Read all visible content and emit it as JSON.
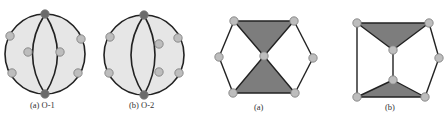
{
  "figure": {
    "panels": [
      {
        "id": "o1",
        "caption": "(a) O-1",
        "shape": "circle",
        "center": [
          45,
          54
        ],
        "radius": 40,
        "fill": "#e6e6e6",
        "stroke": "#222222",
        "arcs": [
          {
            "from": [
              45,
              14
            ],
            "to": [
              45,
              94
            ],
            "control_x": 20
          },
          {
            "from": [
              45,
              14
            ],
            "to": [
              45,
              94
            ],
            "control_x": 70
          }
        ],
        "pole_nodes": [
          [
            45,
            14
          ],
          [
            45,
            94
          ]
        ],
        "nodes": [
          [
            10,
            36
          ],
          [
            12,
            73
          ],
          [
            81,
            39
          ],
          [
            78,
            73
          ],
          [
            28,
            52
          ],
          [
            60,
            52
          ]
        ]
      },
      {
        "id": "o2",
        "caption": "(b) O-2",
        "shape": "circle",
        "center": [
          144,
          55
        ],
        "radius": 40,
        "fill": "#e6e6e6",
        "stroke": "#222222",
        "arcs": [
          {
            "from": [
              144,
              15
            ],
            "to": [
              144,
              95
            ],
            "control_x": 118
          },
          {
            "from": [
              144,
              15
            ],
            "to": [
              144,
              95
            ],
            "control_x": 166
          }
        ],
        "pole_nodes": [
          [
            144,
            15
          ],
          [
            144,
            95
          ]
        ],
        "nodes": [
          [
            110,
            37
          ],
          [
            109,
            73
          ],
          [
            178,
            38
          ],
          [
            179,
            73
          ],
          [
            159,
            44
          ],
          [
            159,
            72
          ]
        ]
      },
      {
        "id": "hex-a",
        "caption": "(a)",
        "shape": "hexagon-bowtie",
        "triangles": [
          [
            [
              234,
              21
            ],
            [
              294,
              21
            ],
            [
              264,
              56
            ]
          ],
          [
            [
              264,
              56
            ],
            [
              233,
              93
            ],
            [
              295,
              93
            ]
          ]
        ],
        "edges": [
          [
            [
              234,
              21
            ],
            [
              219,
              57
            ]
          ],
          [
            [
              219,
              57
            ],
            [
              233,
              93
            ]
          ],
          [
            [
              294,
              21
            ],
            [
              313,
              58
            ]
          ],
          [
            [
              313,
              58
            ],
            [
              295,
              93
            ]
          ]
        ],
        "nodes": [
          [
            234,
            21
          ],
          [
            294,
            21
          ],
          [
            264,
            56
          ],
          [
            313,
            58
          ],
          [
            233,
            93
          ],
          [
            295,
            93
          ],
          [
            219,
            57
          ]
        ]
      },
      {
        "id": "hex-b",
        "caption": "(b)",
        "shape": "split-bowtie",
        "triangles": [
          [
            [
              357,
              23
            ],
            [
              429,
              23
            ],
            [
              393,
              50
            ]
          ],
          [
            [
              393,
              80
            ],
            [
              357,
              97
            ],
            [
              425,
              97
            ]
          ]
        ],
        "edges": [
          [
            [
              357,
              23
            ],
            [
              357,
              97
            ]
          ],
          [
            [
              393,
              50
            ],
            [
              393,
              80
            ]
          ],
          [
            [
              429,
              23
            ],
            [
              439,
              58
            ]
          ],
          [
            [
              439,
              58
            ],
            [
              425,
              97
            ]
          ]
        ],
        "nodes": [
          [
            357,
            23
          ],
          [
            429,
            23
          ],
          [
            393,
            50
          ],
          [
            439,
            58
          ],
          [
            393,
            80
          ],
          [
            357,
            97
          ],
          [
            425,
            97
          ]
        ]
      }
    ],
    "colors": {
      "node_fill": "#bdbdbd",
      "node_stroke": "#7a7a7a",
      "pole_fill": "#6b6b6b",
      "triangle_fill": "#7d7d7d",
      "edge": "#222222"
    },
    "caption_positions": [
      [
        30,
        108
      ],
      [
        129,
        108
      ],
      [
        254,
        110
      ],
      [
        385,
        110
      ]
    ]
  }
}
